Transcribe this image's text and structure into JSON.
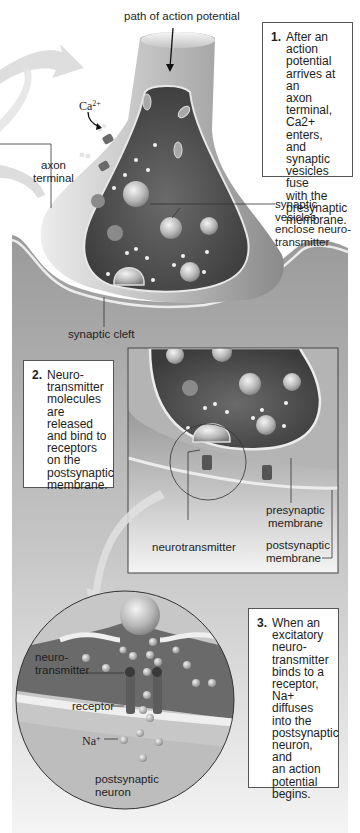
{
  "labels": {
    "path_of_action_potential": "path of action potential",
    "ca_ion_base": "Ca",
    "ca_ion_charge": "2+",
    "axon_terminal": "axon\nterminal",
    "synaptic_vesicles": "synaptic vesicles\nenclose neuro-\ntransmitter",
    "synaptic_cleft": "synaptic cleft",
    "neurotransmitter": "neurotransmitter",
    "presynaptic_membrane": "presynaptic\nmembrane",
    "postsynaptic_membrane": "postsynaptic\nmembrane",
    "zoom_neurotransmitter": "neuro-\ntransmitter",
    "receptor": "receptor",
    "na_ion_base": "Na",
    "na_ion_charge": "+",
    "postsynaptic_neuron": "postsynaptic\nneuron"
  },
  "steps": [
    {
      "number": "1.",
      "text": "After an\naction\npotential\narrives at an\naxon terminal,\nCa2+ enters,\nand synaptic\nvesicles fuse\nwith the\npresynaptic\nmembrane."
    },
    {
      "number": "2.",
      "text": "Neuro-\ntransmitter\nmolecules\nare released\nand bind to\nreceptors\non the\npostsynaptic\nmembrane."
    },
    {
      "number": "3.",
      "text": "When an\nexcitatory\nneuro-\ntransmitter\nbinds to a\nreceptor,\nNa+ diffuses\ninto the\npostsynaptic\nneuron, and\nan action\npotential\nbegins."
    }
  ],
  "colors": {
    "background": "#ffffff",
    "cell_light": "#c9c9c9",
    "cell_mid": "#8f8f8f",
    "cytoplasm_dark": "#4a4a4a",
    "membrane": "#e6e6e6",
    "postsynaptic": "#a9a9a9",
    "box_border": "#555555"
  }
}
